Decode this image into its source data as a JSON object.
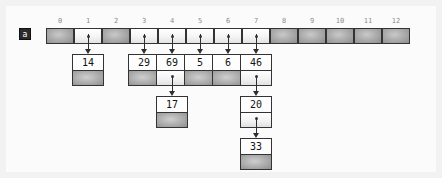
{
  "diagram": {
    "array_label": "a",
    "slot_count": 13,
    "indices": [
      "0",
      "1",
      "2",
      "3",
      "4",
      "5",
      "6",
      "7",
      "8",
      "9",
      "10",
      "11",
      "12"
    ],
    "slots": [
      {
        "index": "0",
        "state": "nil"
      },
      {
        "index": "1",
        "state": "pointer"
      },
      {
        "index": "2",
        "state": "nil"
      },
      {
        "index": "3",
        "state": "pointer"
      },
      {
        "index": "4",
        "state": "pointer"
      },
      {
        "index": "5",
        "state": "pointer"
      },
      {
        "index": "6",
        "state": "pointer"
      },
      {
        "index": "7",
        "state": "pointer"
      },
      {
        "index": "8",
        "state": "nil"
      },
      {
        "index": "9",
        "state": "nil"
      },
      {
        "index": "10",
        "state": "nil"
      },
      {
        "index": "11",
        "state": "nil"
      },
      {
        "index": "12",
        "state": "nil"
      }
    ],
    "chains": [
      {
        "slot": "1",
        "nodes": [
          {
            "value": "14",
            "next": "nil"
          }
        ]
      },
      {
        "slot": "3",
        "nodes": [
          {
            "value": "29",
            "next": "nil"
          }
        ]
      },
      {
        "slot": "4",
        "nodes": [
          {
            "value": "69",
            "next": "pointer"
          },
          {
            "value": "17",
            "next": "nil"
          }
        ]
      },
      {
        "slot": "5",
        "nodes": [
          {
            "value": "5",
            "next": "nil"
          }
        ]
      },
      {
        "slot": "6",
        "nodes": [
          {
            "value": "6",
            "next": "nil"
          }
        ]
      },
      {
        "slot": "7",
        "nodes": [
          {
            "value": "46",
            "next": "pointer"
          },
          {
            "value": "20",
            "next": "pointer"
          },
          {
            "value": "33",
            "next": "nil"
          }
        ]
      }
    ],
    "colors": {
      "background": "#f2f2f2",
      "page": "#fbfbfb",
      "border": "#333333",
      "nil_fill": "#b2b2b2",
      "pointer_fill": "#f4f4f4",
      "index_text": "#8d8d8d",
      "value_text": "#141414",
      "label_fill": "#2b2b2b"
    }
  }
}
